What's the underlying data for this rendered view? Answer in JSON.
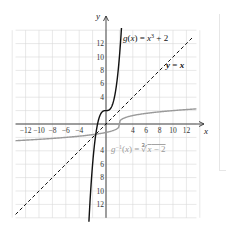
{
  "chart_data": {
    "type": "line",
    "title": "",
    "xlabel": "x",
    "ylabel": "y",
    "xlim": [
      -14,
      14
    ],
    "ylim": [
      -14,
      14
    ],
    "grid": true,
    "grid_step": 2,
    "x_tick_labels": [
      "-12",
      "-10",
      "-8",
      "-6",
      "-4",
      "4",
      "6",
      "8",
      "10",
      "12"
    ],
    "y_tick_labels": [
      "12",
      "10",
      "8",
      "6",
      "4",
      "-4",
      "-6",
      "-8",
      "-10",
      "-12"
    ],
    "series": [
      {
        "name": "g(x) = x^3 + 2",
        "label": "g(x) = x³ + 2",
        "style": "solid",
        "color": "#111111",
        "x": [
          -2.5,
          -2,
          -1.5,
          -1,
          -0.5,
          0,
          0.5,
          1,
          1.5,
          2,
          2.3
        ],
        "y": [
          -13.6,
          -6,
          -1.4,
          1,
          1.9,
          2,
          2.1,
          3,
          5.4,
          10,
          14.2
        ]
      },
      {
        "name": "y = x",
        "label": "y = x",
        "style": "dashed",
        "color": "#111111",
        "x": [
          -14,
          14
        ],
        "y": [
          -14,
          14
        ]
      },
      {
        "name": "g^-1(x) = cbrt(x - 2)",
        "label": "g⁻¹(x) = ∛x − 2",
        "style": "solid",
        "color": "#9a9a9a",
        "x": [
          -14,
          -6,
          -2,
          0,
          1,
          2,
          3,
          4,
          6,
          10,
          14
        ],
        "y": [
          -2.52,
          -2,
          -1.59,
          -1.26,
          -1,
          0,
          1,
          1.26,
          1.59,
          2,
          2.29
        ]
      }
    ]
  },
  "labels": {
    "x_axis": "x",
    "y_axis": "y",
    "g": "g(x) = x³ + 2",
    "identity": "y = x",
    "ginv_prefix": "g",
    "ginv_sup": "−1",
    "ginv_rest": "(x) = ∛x − 2"
  }
}
